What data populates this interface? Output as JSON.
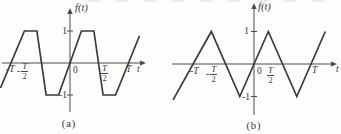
{
  "figure": {
    "background": "#fdfdfc"
  },
  "colors": {
    "line": "#3a3a3a",
    "axis": "#4a4a4a",
    "text": "#383838",
    "background": "#fdfdfc"
  },
  "chart_data": [
    {
      "panel": "a",
      "type": "line",
      "waveform": "trapezoidal periodic wave",
      "title": "f(t)",
      "xlabel": "t",
      "caption": "(a)",
      "amplitude": 1,
      "period_symbol": "T",
      "xlim_in_T": [
        -1.25,
        1.35
      ],
      "ylim": [
        -1.3,
        1.3
      ],
      "grid": false,
      "x_ticks": [
        {
          "value": -1,
          "label": "-T"
        },
        {
          "value": -0.5,
          "label": "-T/2"
        },
        {
          "value": 0,
          "label": "0"
        },
        {
          "value": 0.5,
          "label": "T/2"
        },
        {
          "value": 1,
          "label": "T"
        }
      ],
      "y_ticks": [
        {
          "value": 1,
          "label": "1"
        },
        {
          "value": -1,
          "label": "-1"
        }
      ],
      "fractions": {
        "neg": {
          "sign": "-",
          "num": "T",
          "den": "2"
        },
        "pos": {
          "sign": "",
          "num": "T",
          "den": "2"
        }
      },
      "points": [
        [
          -1.22,
          -0.78
        ],
        [
          -0.8,
          1
        ],
        [
          -0.58,
          1
        ],
        [
          -0.42,
          -1
        ],
        [
          -0.2,
          -1
        ],
        [
          0.2,
          1
        ],
        [
          0.42,
          1
        ],
        [
          0.58,
          -1
        ],
        [
          0.8,
          -1
        ],
        [
          1.22,
          0.85
        ]
      ]
    },
    {
      "panel": "b",
      "type": "line",
      "waveform": "triangular periodic wave",
      "title": "f(t)",
      "xlabel": "t",
      "caption": "(b)",
      "amplitude": 1,
      "period_symbol": "T",
      "xlim_in_T": [
        -1.45,
        1.55
      ],
      "ylim": [
        -1.3,
        1.3
      ],
      "grid": false,
      "x_ticks": [
        {
          "value": -1,
          "label": "-T"
        },
        {
          "value": -0.5,
          "label": "-T/2"
        },
        {
          "value": 0,
          "label": "0"
        },
        {
          "value": 0.5,
          "label": "T/2"
        },
        {
          "value": 1,
          "label": "T"
        }
      ],
      "y_ticks": [
        {
          "value": 1,
          "label": "1"
        },
        {
          "value": -1,
          "label": "-1"
        }
      ],
      "fractions": {
        "neg": {
          "sign": "-",
          "num": "T",
          "den": "2"
        },
        "pos": {
          "sign": "",
          "num": "T",
          "den": "2"
        }
      },
      "points": [
        [
          -1.42,
          -1.1
        ],
        [
          -0.75,
          1
        ],
        [
          -0.25,
          -1
        ],
        [
          0.25,
          1
        ],
        [
          0.75,
          -1
        ],
        [
          1.25,
          1.0
        ]
      ]
    }
  ]
}
